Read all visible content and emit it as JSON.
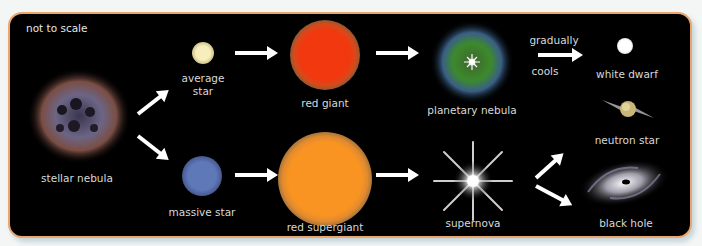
{
  "diagram": {
    "note": "not to scale",
    "colors": {
      "background": "#000000",
      "border": "#e9a66e",
      "text": "#d8d8d8",
      "arrow": "#ffffff"
    },
    "stages": {
      "stellar_nebula": {
        "label": "stellar nebula"
      },
      "average_star": {
        "label_line1": "average",
        "label_line2": "star",
        "color": "#f2e6a6"
      },
      "massive_star": {
        "label": "massive star",
        "color": "#5a74b4"
      },
      "red_giant": {
        "label": "red giant",
        "color": "#f03a10"
      },
      "red_supergiant": {
        "label": "red supergiant",
        "color": "#f7901f"
      },
      "planetary_nebula": {
        "label": "planetary nebula"
      },
      "supernova": {
        "label": "supernova"
      },
      "white_dwarf": {
        "label": "white dwarf"
      },
      "neutron_star": {
        "label": "neutron star"
      },
      "black_hole": {
        "label": "black hole"
      }
    },
    "transition_label": {
      "line1": "gradually",
      "line2": "cools"
    }
  }
}
